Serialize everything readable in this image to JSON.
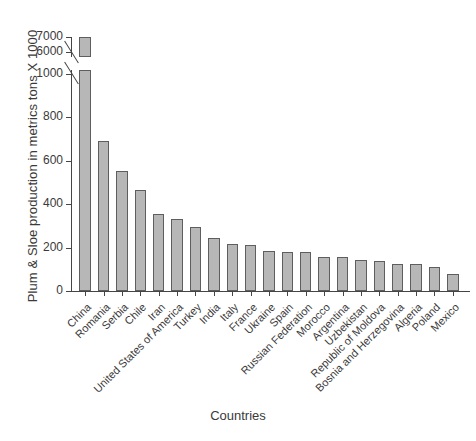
{
  "chart_data": {
    "type": "bar",
    "title": "",
    "xlabel": "Countries",
    "ylabel": "Plum & Sloe production in metrics tons X 1000",
    "categories": [
      "China",
      "Romania",
      "Serbia",
      "Chile",
      "Iran",
      "United States of America",
      "Turkey",
      "India",
      "Italy",
      "France",
      "Ukraine",
      "Spain",
      "Russian Federation",
      "Morocco",
      "Argentina",
      "Uzbekistan",
      "Republic of Moldova",
      "Bosnia and Herzegovina",
      "Algeria",
      "Poland",
      "Mexico"
    ],
    "values": [
      7000,
      690,
      555,
      465,
      355,
      330,
      295,
      245,
      215,
      210,
      185,
      180,
      180,
      155,
      155,
      145,
      140,
      125,
      125,
      110,
      80
    ],
    "ytick_labels": [
      "0",
      "200",
      "400",
      "600",
      "800",
      "1000",
      "6000",
      "7000"
    ],
    "ylim": [
      0,
      1000
    ],
    "axis_break": {
      "present": true,
      "lower_max": 1000,
      "upper_min": 6000,
      "upper_max": 7000
    },
    "grid": false,
    "legend": "none",
    "bar_color": "#b7b7b7",
    "bar_border_color": "#5e5e5e",
    "axis_color": "#454545"
  }
}
